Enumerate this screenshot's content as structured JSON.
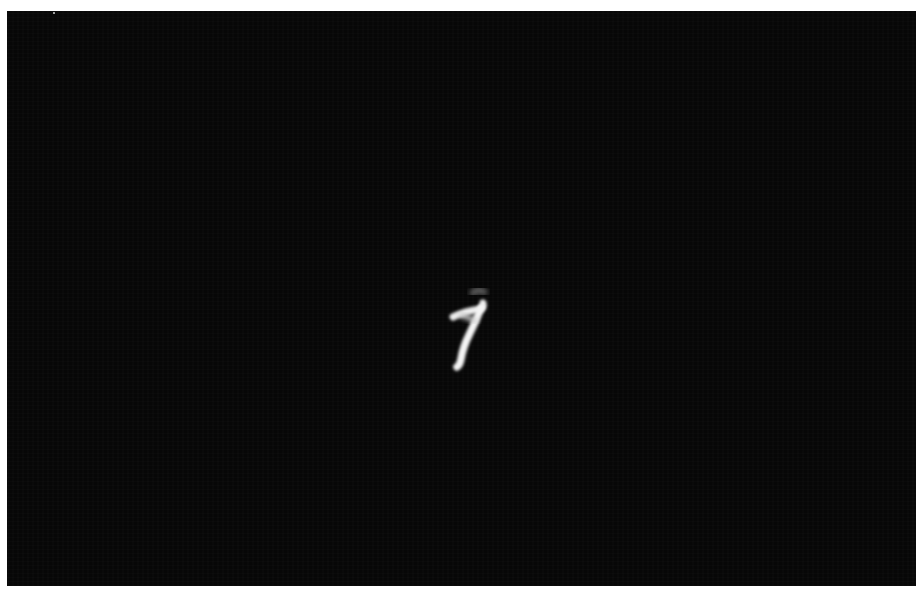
{
  "image": {
    "subject": "handwritten digit",
    "digit_label": "7",
    "background_color": "#070707",
    "stroke_color": "#f2f2f2",
    "border_color": "#ffffff"
  }
}
